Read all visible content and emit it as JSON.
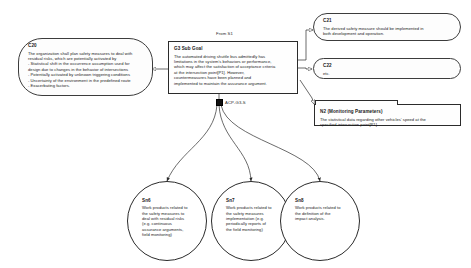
{
  "diagram": {
    "type": "assurance-case-gsn",
    "from_label": "From S1",
    "strategy_label": "ACP-G3-S"
  },
  "nodes": {
    "c20": {
      "id": "C20",
      "text": "The organization shall plan safety measures to deal with\nresidual risks, which are potentially activated by\n- Statistical shift in the occurrence assumption used for\ndesign due to changes in the behavior of intersections\n- Potentially activated by unknown triggering conditions\n- Uncertainty of the environment in the predefined route\n- Exacerbating factors."
    },
    "g3": {
      "id": "G3 Sub Goal",
      "text": "The automated driving shuttle bus admittedly has\nlimitations in the system's behaviors or performance,\nwhich may affect the satisfaction of acceptance criteria\nat the intersection point[P1]. However,\ncountermeasures have been planned and\nimplemented to maintain the assurance argument."
    },
    "c21": {
      "id": "C21",
      "text": "The derived safety measure should be implemented in\nboth development and operation."
    },
    "c22": {
      "id": "C22",
      "text": "etc."
    },
    "n2": {
      "id": "N2 (Monitoring Parameters)",
      "text": "The  statistical data regarding other vehicles' speed at the\nspecified intersection point[P1]."
    },
    "sn6": {
      "id": "Sn6",
      "text": "Work products related to\nthe safety measures to\ndeal with residual risks\n(e.g. continuous\nassurance arguments,\nfield monitoring)"
    },
    "sn7": {
      "id": "Sn7",
      "text": "Work products related to\nthe safety measures\nimplementation (e.g.\nperiodically reports of\nthe field monitoring)"
    },
    "sn8": {
      "id": "Sn8",
      "text": "Work products related to\nthe definition of the\nimpact analysis."
    }
  },
  "colors": {
    "stroke": "#2b2b2b",
    "background": "#ffffff",
    "text": "#1a1a1a"
  }
}
